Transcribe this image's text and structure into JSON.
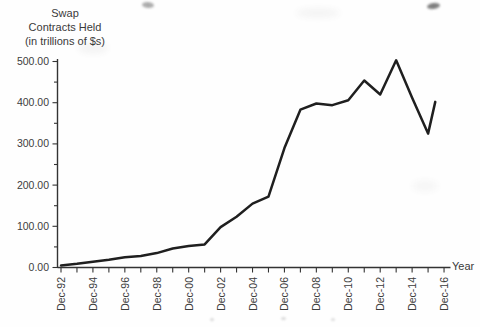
{
  "title": {
    "lines": [
      "Swap",
      "Contracts Held",
      "(in trillions of $s)"
    ]
  },
  "x_axis_label": "Year",
  "colors": {
    "line": "#1f1f1f",
    "axis": "#333333",
    "text": "#3c3c3c"
  },
  "chart_data": {
    "type": "line",
    "title": "Swap Contracts Held (in trillions of $s)",
    "xlabel": "Year",
    "ylabel": "Swap contracts held (trillions of $)",
    "ylim": [
      0,
      500
    ],
    "y_tick_interval": 100,
    "y_minor_tick_interval": 50,
    "y_tick_labels": [
      "0.00",
      "100.00",
      "200.00",
      "300.00",
      "400.00",
      "500.00"
    ],
    "x_tick_labels": [
      "Dec-92",
      "Dec-94",
      "Dec-96",
      "Dec-98",
      "Dec-00",
      "Dec-02",
      "Dec-04",
      "Dec-06",
      "Dec-08",
      "Dec-10",
      "Dec-12",
      "Dec-14",
      "Dec-16"
    ],
    "x_minor_ticks": "unlabeled tick at every odd year",
    "grid": false,
    "legend": "none",
    "line_color": "#1f1f1f",
    "points": [
      {
        "x": "Dec-92",
        "y": 5
      },
      {
        "x": "Dec-93",
        "y": 9
      },
      {
        "x": "Dec-94",
        "y": 14
      },
      {
        "x": "Dec-95",
        "y": 19
      },
      {
        "x": "Dec-96",
        "y": 25
      },
      {
        "x": "Dec-97",
        "y": 28
      },
      {
        "x": "Dec-98",
        "y": 35
      },
      {
        "x": "Dec-99",
        "y": 46
      },
      {
        "x": "Dec-00",
        "y": 52
      },
      {
        "x": "Dec-01",
        "y": 56
      },
      {
        "x": "Dec-02",
        "y": 98
      },
      {
        "x": "Dec-03",
        "y": 123
      },
      {
        "x": "Dec-04",
        "y": 155
      },
      {
        "x": "Dec-05",
        "y": 172
      },
      {
        "x": "Dec-06",
        "y": 290
      },
      {
        "x": "Dec-07",
        "y": 383
      },
      {
        "x": "Dec-08",
        "y": 398
      },
      {
        "x": "Dec-09",
        "y": 394
      },
      {
        "x": "Dec-10",
        "y": 406
      },
      {
        "x": "Dec-11",
        "y": 454
      },
      {
        "x": "Dec-12",
        "y": 420
      },
      {
        "x": "Dec-13",
        "y": 503
      },
      {
        "x": "Dec-14",
        "y": 412
      },
      {
        "x": "Dec-15",
        "y": 325
      },
      {
        "x": "Dec-16",
        "y": 402,
        "t": 23.45,
        "note": "line ends just before the Dec-16 tick"
      }
    ]
  }
}
